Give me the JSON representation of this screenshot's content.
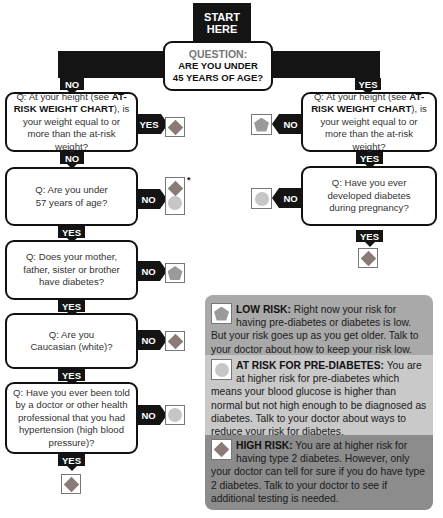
{
  "start": {
    "line1": "START",
    "line2": "HERE"
  },
  "root_question": {
    "label": "QUESTION:",
    "line1": "ARE YOU UNDER",
    "line2": "45 YEARS OF AGE?"
  },
  "branch_labels": {
    "no": "NO",
    "yes": "YES"
  },
  "left_questions": [
    {
      "pre": "Q: At your height (see ",
      "bold": "AT-RISK WEIGHT CHART",
      "post": "), is your weight equal to or more than the at-risk weight?",
      "side_label": "YES",
      "side_result": "high-risk",
      "down_label": "NO"
    },
    {
      "text": "Q: Are you under 57 years of age?",
      "side_label": "NO",
      "side_result": "high-risk-or-pre-diabetes",
      "side_note": "*",
      "down_label": "YES"
    },
    {
      "text": "Q: Does your mother, father, sister or brother have diabetes?",
      "side_label": "NO",
      "side_result": "low-risk",
      "down_label": "YES"
    },
    {
      "text": "Q: Are you Caucasian (white)?",
      "side_label": "NO",
      "side_result": "high-risk",
      "down_label": "YES"
    },
    {
      "text": "Q: Have you ever been told by a doctor or other health professional that you had hypertension (high blood pressure)?",
      "side_label": "NO",
      "side_result": "pre-diabetes",
      "down_label": "YES",
      "down_result": "high-risk"
    }
  ],
  "right_questions": [
    {
      "pre": "Q: At your height (see ",
      "bold": "AT-RISK WEIGHT CHART",
      "post": "), is your weight equal to or more than the at-risk weight?",
      "side_label": "NO",
      "side_result": "low-risk",
      "down_label": "YES"
    },
    {
      "text": "Q: Have you ever developed diabetes during pregnancy?",
      "side_label": "NO",
      "side_result": "pre-diabetes",
      "down_label": "YES",
      "down_result": "high-risk"
    }
  ],
  "legend": {
    "low": {
      "title": "LOW RISK:",
      "text": " Right now your risk for having pre-diabetes or diabetes is low. But your risk goes up as you get older. Talk to your doctor about how to keep your risk low.",
      "icon": "pentagon",
      "color": "#a9a9a9"
    },
    "pre": {
      "title": "AT RISK FOR PRE-DIABETES:",
      "text": " You are at higher risk for pre-diabetes which means your blood glucose is higher than normal but not high enough to be diagnosed as diabetes. Talk to your doctor about ways to reduce your risk for diabetes.",
      "icon": "circle",
      "color": "#c9c9c9"
    },
    "high": {
      "title": "HIGH RISK:",
      "text": " You are at higher risk for having type 2 diabetes. However, only your doctor can tell for sure if you do have type 2 diabetes. Talk to your doctor to see if additional testing is needed.",
      "icon": "diamond",
      "color": "#8c8c8c"
    }
  }
}
